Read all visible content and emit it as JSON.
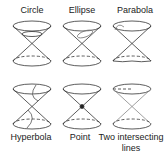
{
  "panels": [
    {
      "label": "Circle"
    },
    {
      "label": "Ellipse"
    },
    {
      "label": "Parabola"
    },
    {
      "label": "Hyperbola"
    },
    {
      "label": "Point"
    },
    {
      "label": "Two intersecting",
      "label2": "lines"
    }
  ]
}
